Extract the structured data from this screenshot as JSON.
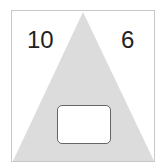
{
  "diagram": {
    "left_number": "10",
    "right_number": "6",
    "answer_box": "",
    "colors": {
      "triangle": "#dcdcdc",
      "border": "#c8c8c8",
      "box_border": "#666666"
    }
  }
}
